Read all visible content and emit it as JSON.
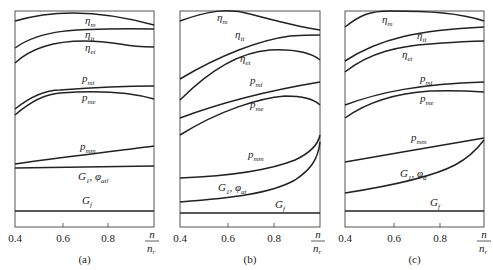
{
  "figure": {
    "panels": [
      {
        "caption": "(a)",
        "frame": {
          "x": 15,
          "y": 11,
          "w": 139,
          "h": 216
        },
        "curves": [
          {
            "name": "eta-m",
            "d": "M15,21 C55,9 100,10 154,25",
            "label": "η",
            "sub": "m",
            "lx": 85,
            "ly": 24
          },
          {
            "name": "eta-it",
            "d": "M15,48 C40,30 70,28 154,29",
            "label": "η",
            "sub": "it",
            "lx": 85,
            "ly": 38
          },
          {
            "name": "eta-et",
            "d": "M15,63 C40,40 80,38 120,44 C135,47 145,47 154,47",
            "label": "η",
            "sub": "et",
            "lx": 85,
            "ly": 51
          },
          {
            "name": "p-mi",
            "d": "M15,109 C30,97 45,90 60,90 C100,87 130,86 154,86",
            "label": "p",
            "sub": "mi",
            "lx": 82,
            "ly": 82
          },
          {
            "name": "p-me",
            "d": "M15,115 C30,102 45,94 60,93 C100,90 130,92 154,99",
            "label": "p",
            "sub": "me",
            "lx": 82,
            "ly": 101
          },
          {
            "name": "p-mm",
            "d": "M15,164 C60,157 110,152 154,146",
            "label": "p",
            "sub": "mm",
            "lx": 80,
            "ly": 150
          },
          {
            "name": "G1-phi",
            "d": "M15,168 L154,166",
            "label": "G",
            "sub": "1",
            "extra": ", φ",
            "extraSub": "atl",
            "lx": 78,
            "ly": 180
          },
          {
            "name": "G-f",
            "d": "M15,211 L154,211",
            "label": "G",
            "sub": "f",
            "lx": 82,
            "ly": 204
          }
        ],
        "xticks": [
          {
            "value": "0.4",
            "x": 15
          },
          {
            "value": "0.6",
            "x": 63
          },
          {
            "value": "0.8",
            "x": 108
          }
        ],
        "xlabel": {
          "num": "n",
          "den": "n",
          "denSub": "r",
          "x": 152
        }
      },
      {
        "caption": "(b)",
        "frame": {
          "x": 180,
          "y": 11,
          "w": 140,
          "h": 216
        },
        "curves": [
          {
            "name": "eta-m",
            "d": "M180,21 C210,10 230,8 250,14 C280,22 300,27 320,30",
            "label": "η",
            "sub": "m",
            "lx": 217,
            "ly": 21
          },
          {
            "name": "eta-it",
            "d": "M180,79 C220,55 260,40 290,36 C305,35 315,35 320,35",
            "label": "η",
            "sub": "it",
            "lx": 235,
            "ly": 38
          },
          {
            "name": "eta-et",
            "d": "M180,100 C210,70 240,52 270,50 C295,49 310,52 320,60",
            "label": "η",
            "sub": "et",
            "lx": 240,
            "ly": 62
          },
          {
            "name": "p-mi",
            "d": "M180,118 C220,103 260,92 320,82",
            "label": "p",
            "sub": "mi",
            "lx": 250,
            "ly": 84
          },
          {
            "name": "p-me",
            "d": "M180,135 C220,110 260,98 285,96 C305,96 315,100 320,105",
            "label": "p",
            "sub": "me",
            "lx": 250,
            "ly": 108
          },
          {
            "name": "p-mm",
            "d": "M180,178 C230,176 270,170 295,160 C310,153 318,145 320,135",
            "label": "p",
            "sub": "mm",
            "lx": 248,
            "ly": 158
          },
          {
            "name": "G1-phi",
            "d": "M180,202 C230,198 270,194 295,180 C310,170 318,160 320,142",
            "label": "G",
            "sub": "1",
            "extra": ", φ",
            "extraSub": "at",
            "lx": 218,
            "ly": 191
          },
          {
            "name": "G-f",
            "d": "M180,213 L320,213",
            "label": "G",
            "sub": "f",
            "lx": 275,
            "ly": 208
          }
        ],
        "xticks": [
          {
            "value": "0.4",
            "x": 180
          },
          {
            "value": "0.6",
            "x": 228
          },
          {
            "value": "0.8",
            "x": 274
          }
        ],
        "xlabel": {
          "num": "n",
          "den": "n",
          "denSub": "r",
          "x": 318
        }
      },
      {
        "caption": "(c)",
        "frame": {
          "x": 345,
          "y": 11,
          "w": 139,
          "h": 216
        },
        "curves": [
          {
            "name": "eta-m",
            "d": "M345,27 C360,15 370,11 390,11 C430,11 460,13 484,21",
            "label": "η",
            "sub": "m",
            "lx": 382,
            "ly": 23
          },
          {
            "name": "eta-it",
            "d": "M345,61 C380,38 420,30 484,27",
            "label": "η",
            "sub": "it",
            "lx": 417,
            "ly": 39
          },
          {
            "name": "eta-et",
            "d": "M345,72 C370,52 400,46 430,44 C455,42 470,41 484,41",
            "label": "η",
            "sub": "et",
            "lx": 402,
            "ly": 58
          },
          {
            "name": "p-mi",
            "d": "M345,105 C380,92 420,84 484,82",
            "label": "p",
            "sub": "mi",
            "lx": 420,
            "ly": 82
          },
          {
            "name": "p-me",
            "d": "M345,118 C370,100 400,93 430,91 C455,90 470,91 484,92",
            "label": "p",
            "sub": "me",
            "lx": 420,
            "ly": 102
          },
          {
            "name": "p-mm",
            "d": "M345,162 C390,154 440,146 484,138",
            "label": "p",
            "sub": "mm",
            "lx": 411,
            "ly": 141
          },
          {
            "name": "G1-phi",
            "d": "M345,193 C390,186 430,178 455,165 C470,157 478,148 484,140",
            "label": "G",
            "sub": "1",
            "extra": ", φ",
            "extraSub": "a",
            "lx": 400,
            "ly": 177
          },
          {
            "name": "G-f",
            "d": "M345,211 L484,211",
            "label": "G",
            "sub": "f",
            "lx": 430,
            "ly": 206
          }
        ],
        "xticks": [
          {
            "value": "0.4",
            "x": 345
          },
          {
            "value": "0.6",
            "x": 394
          },
          {
            "value": "0.8",
            "x": 440
          }
        ],
        "xlabel": {
          "num": "n",
          "den": "n",
          "denSub": "r",
          "x": 484
        }
      }
    ]
  }
}
